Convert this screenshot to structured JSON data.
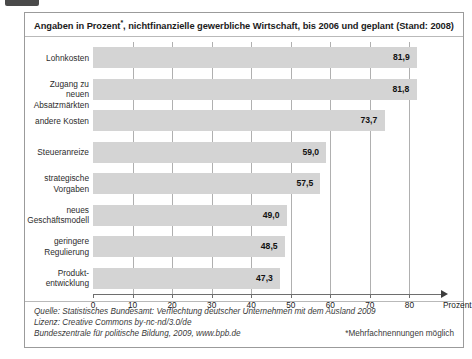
{
  "figure": {
    "title": "Angaben in Prozent*, nichtfinanzielle gewerbliche Wirtschaft, bis 2006 und geplant (Stand: 2008)",
    "axis_unit": "Prozent",
    "footnote": "*Mehrfachnennungen möglich",
    "source_line_1": "Quelle: Statistisches Bundesamt: Verflechtung deutscher Unternehmen mit dem Ausland 2009",
    "source_line_2": "Lizenz: Creative Commons by-nc-nd/3.0/de",
    "source_line_3": "Bundeszentrale für politische Bildung, 2009, www.bpb.de"
  },
  "chart_data": {
    "type": "bar",
    "orientation": "horizontal",
    "title": "Angaben in Prozent*, nichtfinanzielle gewerbliche Wirtschaft, bis 2006 und geplant (Stand: 2008)",
    "xlabel": "Prozent",
    "ylabel": "",
    "xlim": [
      0,
      90
    ],
    "xticks": [
      0,
      10,
      20,
      30,
      40,
      50,
      60,
      70,
      80
    ],
    "xticklabels": [
      "0",
      "10",
      "20",
      "30",
      "40",
      "50",
      "60",
      "70",
      "80"
    ],
    "grid": true,
    "legend": false,
    "bar_color": "#d4d4d4",
    "categories": [
      "Lohnkosten",
      "Zugang zu neuen\nAbsatzmärkten",
      "andere Kosten",
      "Steueranreize",
      "strategische\nVorgaben",
      "neues\nGeschäftsmodell",
      "geringere\nRegulierung",
      "Produkt-\nentwicklung"
    ],
    "values": [
      81.9,
      81.8,
      73.7,
      59.0,
      57.5,
      49.0,
      48.5,
      47.3
    ],
    "value_labels": [
      "81,9",
      "81,8",
      "73,7",
      "59,0",
      "57,5",
      "49,0",
      "48,5",
      "47,3"
    ]
  }
}
